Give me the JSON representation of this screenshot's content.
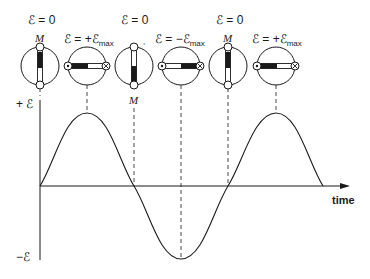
{
  "figure": {
    "type": "emf-vs-time-rotating-coil",
    "axes": {
      "y_positive_label": "+ ℰ",
      "y_negative_label": "−ℰ",
      "x_label": "time"
    },
    "curve": {
      "shape": "sine",
      "periods_shown": 1.5,
      "start_value": 0
    },
    "coils": [
      {
        "position": 0,
        "emf_label": "ℰ = 0",
        "marker_label": "M",
        "orientation": "vertical",
        "marker_side": "top"
      },
      {
        "position": 1,
        "emf_label": "ℰ = +ℰ",
        "emf_sub": "max",
        "orientation": "horizontal",
        "left_symbol": "dot",
        "right_symbol": "cross"
      },
      {
        "position": 2,
        "emf_label": "ℰ = 0",
        "marker_label": "M",
        "orientation": "vertical",
        "marker_side": "bottom"
      },
      {
        "position": 3,
        "emf_label": "ℰ = −ℰ",
        "emf_sub": "max",
        "orientation": "horizontal",
        "left_symbol": "dot",
        "right_symbol": "cross"
      },
      {
        "position": 4,
        "emf_label": "ℰ = 0",
        "marker_label": "M",
        "orientation": "vertical",
        "marker_side": "top"
      },
      {
        "position": 5,
        "emf_label": "ℰ = +ℰ",
        "emf_sub": "max",
        "orientation": "horizontal",
        "left_symbol": "dot",
        "right_symbol": "cross"
      }
    ],
    "colors": {
      "ink": "#1a1a1a",
      "background": "#ffffff"
    }
  }
}
